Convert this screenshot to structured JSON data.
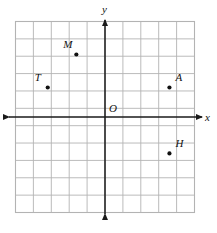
{
  "figure": {
    "width": 217,
    "height": 233,
    "background_color": "#ffffff"
  },
  "chart_data": {
    "type": "scatter",
    "title": "",
    "xlabel": "x",
    "ylabel": "y",
    "grid": true,
    "legend": null,
    "xlim": [
      -5.0,
      5.0
    ],
    "ylim": [
      -5.5,
      5.5
    ],
    "grid_step": 1,
    "grid_columns": 10,
    "grid_rows": 11,
    "grid_color": "#b3b3b3",
    "axis_color": "#1a1a1a",
    "point_color": "#111111",
    "points": [
      {
        "name": "M",
        "x": -1.6,
        "y": 3.6,
        "label": "M",
        "label_position": "upper-left"
      },
      {
        "name": "T",
        "x": -3.2,
        "y": 1.7,
        "label": "T",
        "label_position": "upper-left"
      },
      {
        "name": "A",
        "x": 3.6,
        "y": 1.7,
        "label": "A",
        "label_position": "upper-right"
      },
      {
        "name": "H",
        "x": 3.6,
        "y": -2.1,
        "label": "H",
        "label_position": "upper-right"
      }
    ],
    "origin": {
      "label": "O",
      "x": 0,
      "y": 0
    },
    "axis_arrows": {
      "x_left": true,
      "x_right": true,
      "y_up": true,
      "y_down": true
    }
  },
  "labels": {
    "x_axis": "x",
    "y_axis": "y",
    "origin": "O",
    "point_m": "M",
    "point_t": "T",
    "point_a": "A",
    "point_h": "H"
  }
}
